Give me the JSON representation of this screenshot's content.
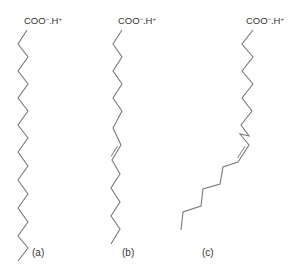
{
  "colors": {
    "bond": "#7a7a7a",
    "text": "#333333",
    "background": "#ffffff"
  },
  "molecules": [
    {
      "id": "a",
      "label": "(a)",
      "head": {
        "base": "COO",
        "charge1": "–",
        "mid": ".H",
        "charge2": "+"
      },
      "head_pos": [
        24,
        24
      ],
      "label_pos": [
        32,
        256
      ],
      "chain": [
        [
          27,
          30
        ],
        [
          18,
          44
        ],
        [
          28,
          57
        ],
        [
          18,
          71
        ],
        [
          28,
          84
        ],
        [
          18,
          98
        ],
        [
          28,
          111
        ],
        [
          18,
          125
        ],
        [
          28,
          138
        ],
        [
          18,
          152
        ],
        [
          28,
          166
        ],
        [
          18,
          180
        ],
        [
          28,
          194
        ],
        [
          18,
          208
        ],
        [
          28,
          222
        ],
        [
          18,
          236
        ],
        [
          28,
          248
        ],
        [
          18,
          261
        ]
      ],
      "double_bonds": []
    },
    {
      "id": "b",
      "label": "(b)",
      "head": {
        "base": "COO",
        "charge1": "–",
        "mid": ".H",
        "charge2": "+"
      },
      "head_pos": [
        118,
        24
      ],
      "label_pos": [
        122,
        256
      ],
      "chain": [
        [
          122,
          30
        ],
        [
          113,
          44
        ],
        [
          122,
          57
        ],
        [
          113,
          71
        ],
        [
          122,
          84
        ],
        [
          113,
          98
        ],
        [
          122,
          111
        ],
        [
          113,
          128
        ],
        [
          121,
          145
        ],
        [
          112,
          160
        ],
        [
          120,
          174
        ],
        [
          111,
          188
        ],
        [
          120,
          202
        ],
        [
          111,
          216
        ],
        [
          120,
          229
        ],
        [
          111,
          244
        ]
      ],
      "double_bonds": [
        [
          [
            121,
            145
          ],
          [
            112,
            160
          ]
        ]
      ]
    },
    {
      "id": "c",
      "label": "(c)",
      "head": {
        "base": "COO",
        "charge1": "–",
        "mid": ".H",
        "charge2": "+"
      },
      "head_pos": [
        246,
        24
      ],
      "label_pos": [
        202,
        256
      ],
      "chain": [
        [
          253,
          30
        ],
        [
          242,
          44
        ],
        [
          253,
          57
        ],
        [
          242,
          71
        ],
        [
          253,
          84
        ],
        [
          242,
          98
        ],
        [
          252,
          111
        ],
        [
          241,
          125
        ],
        [
          249,
          136
        ],
        [
          240,
          134
        ],
        [
          249,
          145
        ],
        [
          238,
          162
        ],
        [
          223,
          167
        ],
        [
          220,
          184
        ],
        [
          203,
          189
        ],
        [
          201,
          206
        ],
        [
          183,
          212
        ],
        [
          181,
          230
        ]
      ],
      "double_bonds": [
        [
          [
            249,
            145
          ],
          [
            238,
            162
          ]
        ]
      ]
    }
  ]
}
